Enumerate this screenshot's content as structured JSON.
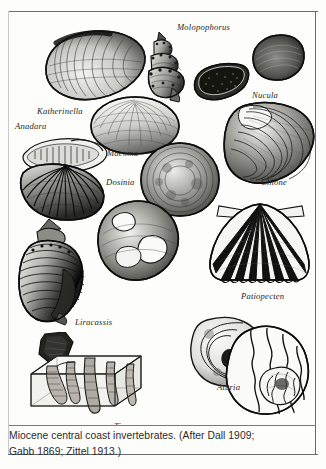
{
  "plate": {
    "kind": "scientific-illustration-plate",
    "subject": "Miocene central coast invertebrates",
    "ink_color": "#1a1a1a",
    "paper_color": "#fdfdfc",
    "rule_color": "#6d6d6d"
  },
  "specimens": [
    {
      "id": "katherinella",
      "label": "Katherinella",
      "group": "bivalve",
      "form": "elongate-clam"
    },
    {
      "id": "molopophorus",
      "label": "Molopophorus",
      "group": "gastropod",
      "form": "knobbed-spired-snail"
    },
    {
      "id": "nucula",
      "label": "Nucula",
      "group": "bivalve",
      "form": "small-oval-nutclam"
    },
    {
      "id": "anadara",
      "label": "Anadara",
      "group": "bivalve",
      "form": "ribbed-arkshell"
    },
    {
      "id": "macoma",
      "label": "Macoma",
      "group": "bivalve",
      "form": "smooth-rounded-clam"
    },
    {
      "id": "chione",
      "label": "Chione",
      "group": "bivalve",
      "form": "concentric-venus-clam"
    },
    {
      "id": "dosinia",
      "label": "Dosinia",
      "group": "bivalve",
      "form": "circular-disk-clam"
    },
    {
      "id": "patiopecten",
      "label": "Patiopecten",
      "group": "bivalve",
      "form": "radially-ribbed-scallop"
    },
    {
      "id": "liracassis",
      "label": "Liracassis",
      "group": "gastropod",
      "form": "large-helmet-snail"
    },
    {
      "id": "tisoa",
      "label": "Tisoa",
      "group": "trace-fossil",
      "form": "burrow-block-diagram"
    },
    {
      "id": "aturia",
      "label": "Aturia",
      "group": "cephalopod",
      "form": "coiled-nautiloid"
    }
  ],
  "caption": {
    "line1": "Miocene central coast invertebrates. (After Dall 1909;",
    "line2": "Gabb 1869; Zittel 1913.)"
  }
}
